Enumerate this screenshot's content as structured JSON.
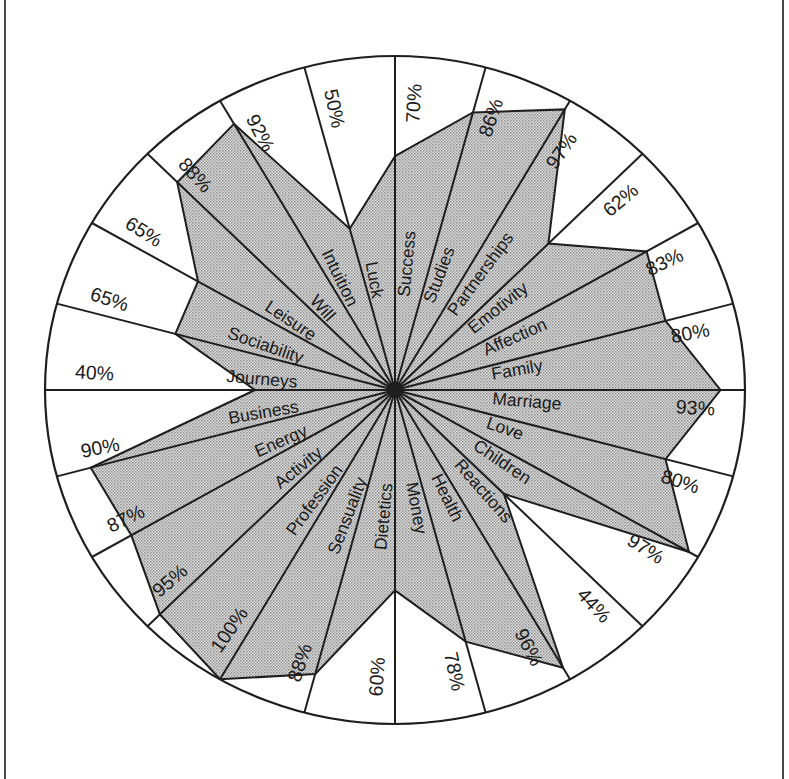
{
  "chart_data": {
    "type": "radar",
    "title": "",
    "xlabel": "",
    "ylabel": "",
    "ylim": [
      0,
      100
    ],
    "grid": false,
    "legend": null,
    "start_angle_deg": 0,
    "direction": "clockwise",
    "categories": [
      "Success",
      "Studies",
      "Partnerships",
      "Emotivity",
      "Affection",
      "Family",
      "Marriage",
      "Love",
      "Children",
      "Reactions",
      "Health",
      "Money",
      "Dietetics",
      "Sensuality",
      "Profession",
      "Activity",
      "Energy",
      "Business",
      "Journeys",
      "Sociability",
      "Leisure",
      "Will",
      "Intuition",
      "Luck"
    ],
    "values": [
      70,
      86,
      97,
      62,
      83,
      80,
      93,
      80,
      97,
      44,
      96,
      78,
      60,
      88,
      100,
      95,
      87,
      90,
      40,
      65,
      65,
      88,
      92,
      50
    ],
    "value_labels": [
      "70%",
      "86%",
      "97%",
      "62%",
      "83%",
      "80%",
      "93%",
      "80%",
      "97%",
      "44%",
      "96%",
      "78%",
      "60%",
      "88%",
      "100%",
      "95%",
      "87%",
      "90%",
      "40%",
      "65%",
      "65%",
      "88%",
      "92%",
      "50%"
    ]
  },
  "style": {
    "line_color": "#1e1e1e",
    "fill_light": "#e0e0e0",
    "fill_dot_dark": "#8a8a8a",
    "fill_dot_mid": "#a2a2a2",
    "text_color": "#1a1a1a",
    "background": "#ffffff"
  }
}
